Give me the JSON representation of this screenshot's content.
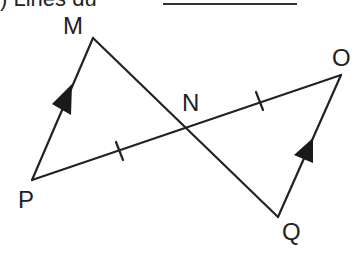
{
  "header": {
    "clipped_text": ") Lines du",
    "answer_blank": ""
  },
  "diagram": {
    "points": {
      "M": {
        "label": "M",
        "x": 93,
        "y": 38
      },
      "N": {
        "label": "N",
        "x": 184,
        "y": 127
      },
      "O": {
        "label": "O",
        "x": 341,
        "y": 75
      },
      "P": {
        "label": "P",
        "x": 32,
        "y": 180
      },
      "Q": {
        "label": "Q",
        "x": 278,
        "y": 217
      }
    },
    "segments": [
      "MP",
      "MQ",
      "PO",
      "QO"
    ],
    "markings": {
      "parallel_arrows": [
        "PM",
        "QO"
      ],
      "congruent_ticks": [
        "PN",
        "NO"
      ]
    },
    "colors": {
      "stroke": "#222222",
      "label": "#222222"
    }
  }
}
